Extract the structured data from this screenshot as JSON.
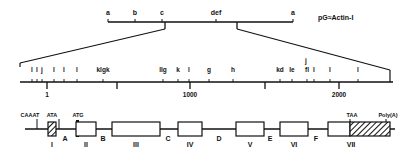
{
  "title": "pG≈Actin-I",
  "top_map": {
    "sites": [
      {
        "label": "a",
        "x": 108
      },
      {
        "label": "b",
        "x": 135
      },
      {
        "label": "c",
        "x": 162
      },
      {
        "label": "def",
        "x": 216
      },
      {
        "label": "a",
        "x": 293
      }
    ],
    "expand_left_x": 165,
    "expand_right_x": 237
  },
  "scale_map": {
    "top_labels": [
      {
        "text": "l",
        "x": 32
      },
      {
        "text": "l",
        "x": 37
      },
      {
        "text": "j",
        "x": 42
      },
      {
        "text": "l",
        "x": 54
      },
      {
        "text": "l",
        "x": 64
      },
      {
        "text": "l",
        "x": 77
      },
      {
        "text": "klgk",
        "x": 103
      },
      {
        "text": "llg",
        "x": 163
      },
      {
        "text": "k",
        "x": 178
      },
      {
        "text": "l",
        "x": 189
      },
      {
        "text": "g",
        "x": 209
      },
      {
        "text": "h",
        "x": 233
      },
      {
        "text": "kd",
        "x": 280
      },
      {
        "text": "le",
        "x": 292
      },
      {
        "text": "j",
        "x": 306
      },
      {
        "text": "fl",
        "x": 307
      },
      {
        "text": "l",
        "x": 314
      },
      {
        "text": "l",
        "x": 330
      },
      {
        "text": "l",
        "x": 358
      }
    ],
    "ticks": [
      {
        "label": "1",
        "x": 47
      },
      {
        "label": "",
        "x": 117
      },
      {
        "label": "1000",
        "x": 190
      },
      {
        "label": "",
        "x": 265
      },
      {
        "label": "2000",
        "x": 339
      }
    ]
  },
  "gene": {
    "promoter_labels": [
      {
        "text": "CAAAT",
        "x": 30
      },
      {
        "text": "ATA",
        "x": 52
      },
      {
        "text": "ATG",
        "x": 78
      },
      {
        "text": "TAA",
        "x": 352
      },
      {
        "text": "Poly(A)",
        "x": 388
      }
    ],
    "exons": [
      {
        "label": "I",
        "x": 48,
        "w": 8,
        "hatched": true
      },
      {
        "label": "II",
        "x": 76,
        "w": 20,
        "hatched": false
      },
      {
        "label": "III",
        "x": 112,
        "w": 48,
        "hatched": false
      },
      {
        "label": "IV",
        "x": 178,
        "w": 24,
        "hatched": false
      },
      {
        "label": "V",
        "x": 236,
        "w": 28,
        "hatched": false
      },
      {
        "label": "VI",
        "x": 280,
        "w": 28,
        "hatched": false
      },
      {
        "label": "VII",
        "x": 328,
        "w": 22,
        "hatched": false
      },
      {
        "label": "",
        "x": 350,
        "w": 40,
        "hatched": true
      }
    ],
    "introns": [
      {
        "label": "A",
        "x": 65
      },
      {
        "label": "B",
        "x": 103
      },
      {
        "label": "C",
        "x": 168
      },
      {
        "label": "D",
        "x": 219
      },
      {
        "label": "E",
        "x": 270
      },
      {
        "label": "F",
        "x": 316
      }
    ]
  }
}
